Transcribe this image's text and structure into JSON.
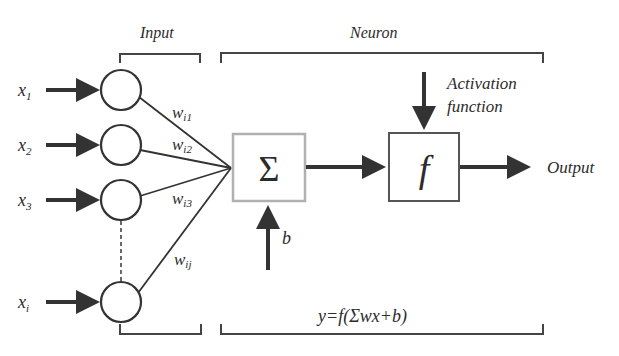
{
  "diagram": {
    "title_input": "Input",
    "title_neuron": "Neuron",
    "inputs": [
      {
        "label": "x",
        "sub": "1",
        "weight": "w",
        "weight_sub": "i1"
      },
      {
        "label": "x",
        "sub": "2",
        "weight": "w",
        "weight_sub": "i2"
      },
      {
        "label": "x",
        "sub": "3",
        "weight": "w",
        "weight_sub": "i3"
      },
      {
        "label": "x",
        "sub": "i",
        "weight": "w",
        "weight_sub": "ij"
      }
    ],
    "summation_symbol": "Σ",
    "bias_label": "b",
    "activation_label_line1": "Activation",
    "activation_label_line2": "function",
    "activation_symbol": "f",
    "output_label": "Output",
    "formula": "y=f(Σwx+b)",
    "colors": {
      "stroke": "#333333",
      "summation_border": "#b0b0b0",
      "text": "#2b2b2b",
      "background": "#ffffff"
    }
  }
}
